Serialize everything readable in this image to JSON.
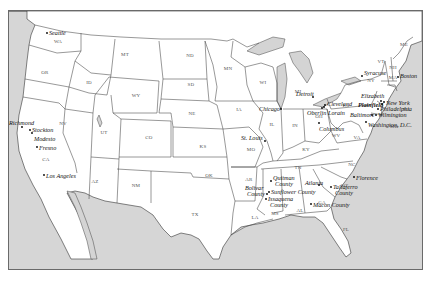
{
  "map": {
    "title": "",
    "colors": {
      "land": "#ffffff",
      "water": "#d6d6d6",
      "border": "#333333",
      "frame": "#6a6a6a"
    },
    "states": [
      {
        "abbr": "WA",
        "x": 57,
        "y": 42
      },
      {
        "abbr": "OR",
        "x": 44,
        "y": 73
      },
      {
        "abbr": "CA",
        "x": 45,
        "y": 160
      },
      {
        "abbr": "NV",
        "x": 62,
        "y": 124
      },
      {
        "abbr": "ID",
        "x": 88,
        "y": 83
      },
      {
        "abbr": "MT",
        "x": 124,
        "y": 55
      },
      {
        "abbr": "WY",
        "x": 135,
        "y": 96
      },
      {
        "abbr": "UT",
        "x": 103,
        "y": 133
      },
      {
        "abbr": "AZ",
        "x": 94,
        "y": 182
      },
      {
        "abbr": "CO",
        "x": 148,
        "y": 138
      },
      {
        "abbr": "NM",
        "x": 135,
        "y": 186
      },
      {
        "abbr": "ND",
        "x": 189,
        "y": 56
      },
      {
        "abbr": "SD",
        "x": 190,
        "y": 85
      },
      {
        "abbr": "NE",
        "x": 191,
        "y": 114
      },
      {
        "abbr": "KS",
        "x": 202,
        "y": 147
      },
      {
        "abbr": "OK",
        "x": 208,
        "y": 176
      },
      {
        "abbr": "TX",
        "x": 194,
        "y": 215
      },
      {
        "abbr": "MN",
        "x": 227,
        "y": 69
      },
      {
        "abbr": "IA",
        "x": 238,
        "y": 110
      },
      {
        "abbr": "MO",
        "x": 250,
        "y": 150
      },
      {
        "abbr": "AR",
        "x": 248,
        "y": 180
      },
      {
        "abbr": "LA",
        "x": 254,
        "y": 218
      },
      {
        "abbr": "WI",
        "x": 262,
        "y": 83
      },
      {
        "abbr": "IL",
        "x": 271,
        "y": 125
      },
      {
        "abbr": "MI",
        "x": 297,
        "y": 92
      },
      {
        "abbr": "IN",
        "x": 294,
        "y": 126
      },
      {
        "abbr": "OH",
        "x": 318,
        "y": 117
      },
      {
        "abbr": "KY",
        "x": 305,
        "y": 150
      },
      {
        "abbr": "TN",
        "x": 297,
        "y": 168
      },
      {
        "abbr": "MS",
        "x": 274,
        "y": 214
      },
      {
        "abbr": "AL",
        "x": 299,
        "y": 211
      },
      {
        "abbr": "GA",
        "x": 321,
        "y": 203
      },
      {
        "abbr": "FL",
        "x": 345,
        "y": 230
      },
      {
        "abbr": "SC",
        "x": 343,
        "y": 186
      },
      {
        "abbr": "NC",
        "x": 351,
        "y": 165
      },
      {
        "abbr": "VA",
        "x": 356,
        "y": 138
      },
      {
        "abbr": "WV",
        "x": 335,
        "y": 136
      },
      {
        "abbr": "PA",
        "x": 345,
        "y": 106
      },
      {
        "abbr": "NY",
        "x": 370,
        "y": 81
      },
      {
        "abbr": "VT",
        "x": 380,
        "y": 62
      },
      {
        "abbr": "NH",
        "x": 392,
        "y": 68
      },
      {
        "abbr": "ME",
        "x": 403,
        "y": 45
      },
      {
        "abbr": "MA",
        "x": 392,
        "y": 78
      },
      {
        "abbr": "NJ",
        "x": 405,
        "y": 110
      },
      {
        "abbr": "MD",
        "x": 393,
        "y": 127
      }
    ],
    "cities": [
      {
        "name": "Seattle",
        "x": 46,
        "y": 32,
        "dx": 2,
        "dy": 0,
        "bold": false
      },
      {
        "name": "Richmond",
        "x": 21,
        "y": 126,
        "dx": -13,
        "dy": -4,
        "bold": false
      },
      {
        "name": "Stockton",
        "x": 29,
        "y": 129,
        "dx": 2,
        "dy": 0,
        "bold": false
      },
      {
        "name": "Modesto",
        "x": 31,
        "y": 132,
        "dx": 2,
        "dy": 6,
        "bold": false
      },
      {
        "name": "Fresno",
        "x": 36,
        "y": 146,
        "dx": 2,
        "dy": 1,
        "bold": false
      },
      {
        "name": "Los Angeles",
        "x": 43,
        "y": 174,
        "dx": 2,
        "dy": 1,
        "bold": false
      },
      {
        "name": "St. Louis",
        "x": 264,
        "y": 140,
        "dx": -24,
        "dy": -3,
        "bold": false
      },
      {
        "name": "Chicago",
        "x": 280,
        "y": 108,
        "dx": -22,
        "dy": 0,
        "bold": false
      },
      {
        "name": "Detroit",
        "x": 312,
        "y": 96,
        "dx": -17,
        "dy": -3,
        "bold": false
      },
      {
        "name": "Cleveland",
        "x": 324,
        "y": 104,
        "dx": 2,
        "dy": -1,
        "bold": false
      },
      {
        "name": "Oberlin",
        "x": 321,
        "y": 107,
        "dx": -15,
        "dy": 5,
        "bold": false
      },
      {
        "name": "Lorain",
        "x": 323,
        "y": 106,
        "dx": 4,
        "dy": 6,
        "bold": false
      },
      {
        "name": "Columbus",
        "x": 318,
        "y": 122,
        "dx": 0,
        "dy": 6,
        "bold": false
      },
      {
        "name": "Syracuse",
        "x": 361,
        "y": 75,
        "dx": 2,
        "dy": -3,
        "bold": false
      },
      {
        "name": "Boston",
        "x": 397,
        "y": 76,
        "dx": 2,
        "dy": -1,
        "bold": false
      },
      {
        "name": "Elizabeth",
        "x": 380,
        "y": 100,
        "dx": -20,
        "dy": -5,
        "bold": false
      },
      {
        "name": "Plainfield",
        "x": 381,
        "y": 103,
        "dx": -24,
        "dy": 1,
        "bold": true
      },
      {
        "name": "New York",
        "x": 383,
        "y": 101,
        "dx": 2,
        "dy": 1,
        "bold": false
      },
      {
        "name": "Philadelphia",
        "x": 377,
        "y": 108,
        "dx": 2,
        "dy": 0,
        "bold": false
      },
      {
        "name": "Wilmington",
        "x": 375,
        "y": 114,
        "dx": 2,
        "dy": 0,
        "bold": false
      },
      {
        "name": "Baltimore",
        "x": 371,
        "y": 114,
        "dx": -22,
        "dy": 0,
        "bold": false
      },
      {
        "name": "Washington, D.C.",
        "x": 365,
        "y": 121,
        "dx": 2,
        "dy": 3,
        "bold": false
      },
      {
        "name": "Quitman County",
        "x": 270,
        "y": 180,
        "dx": 2,
        "dy": -3,
        "bold": false,
        "line2": "County"
      },
      {
        "name": "Bolivar County",
        "x": 266,
        "y": 193,
        "dx": -22,
        "dy": -6,
        "bold": false,
        "line2": "County"
      },
      {
        "name": "Sunflower County",
        "x": 268,
        "y": 191,
        "dx": 2,
        "dy": 0,
        "bold": false
      },
      {
        "name": "Issaquena County",
        "x": 265,
        "y": 198,
        "dx": 2,
        "dy": 0,
        "bold": false,
        "line2": "County"
      },
      {
        "name": "Atlanta",
        "x": 318,
        "y": 184,
        "dx": -14,
        "dy": -2,
        "bold": false
      },
      {
        "name": "Taliaferro County",
        "x": 330,
        "y": 186,
        "dx": 2,
        "dy": 0,
        "bold": false,
        "line2": "County"
      },
      {
        "name": "Macon County",
        "x": 310,
        "y": 203,
        "dx": 2,
        "dy": 1,
        "bold": false
      },
      {
        "name": "Florence",
        "x": 353,
        "y": 176,
        "dx": 2,
        "dy": 1,
        "bold": false
      }
    ]
  }
}
